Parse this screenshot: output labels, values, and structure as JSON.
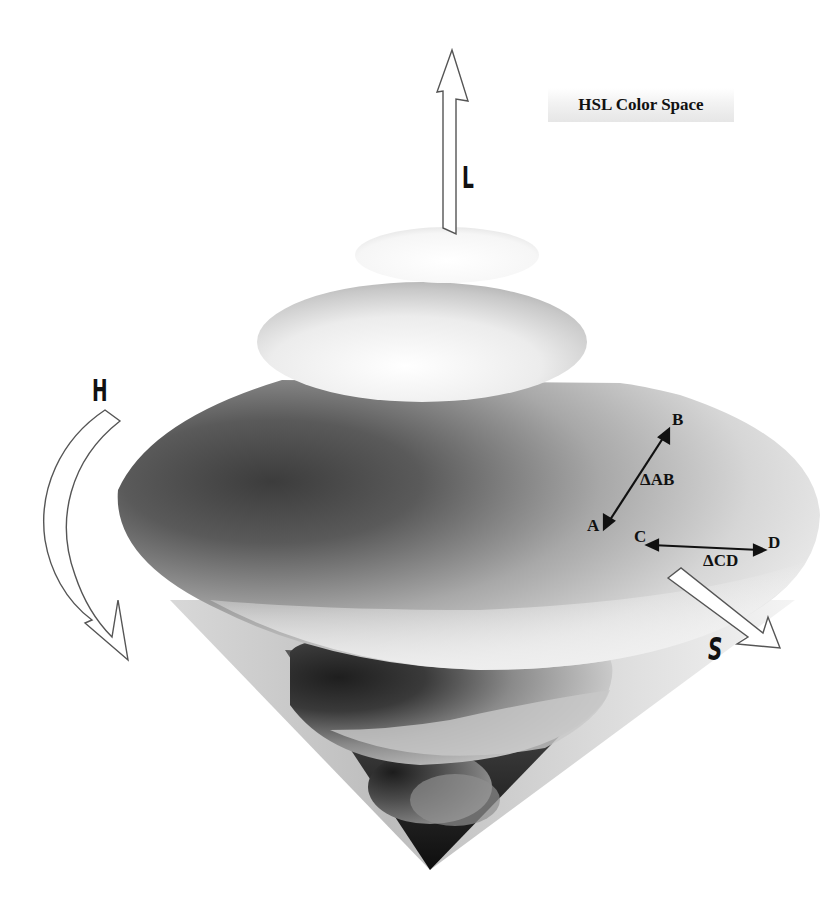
{
  "title": "HSL Color Space",
  "axes": {
    "lightness": {
      "label": "L",
      "direction": "up"
    },
    "hue": {
      "label": "H",
      "direction": "curved-around"
    },
    "saturation": {
      "label": "S",
      "direction": "outward"
    }
  },
  "points": {
    "a": "A",
    "b": "B",
    "c": "C",
    "d": "D"
  },
  "distances": {
    "ab": "ΔAB",
    "cd": "ΔCD"
  },
  "colors": {
    "background": "#ffffff",
    "ink": "#111111",
    "dark_shade": "#3a3a3a",
    "light_shade": "#f5f5f5"
  }
}
